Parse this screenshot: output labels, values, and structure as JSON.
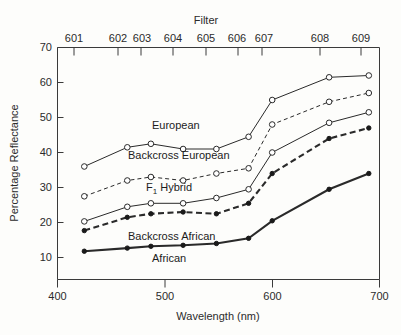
{
  "chart_data": {
    "type": "line",
    "title": "",
    "top_axis_label": "Filter",
    "xlabel": "Wavelength (nm)",
    "ylabel": "Percentage Reflectance",
    "xlim": [
      400,
      700
    ],
    "ylim": [
      10,
      70
    ],
    "xticks": [
      400,
      500,
      600,
      700
    ],
    "yticks": [
      10,
      20,
      30,
      40,
      50,
      60,
      70
    ],
    "grid": false,
    "legend_position": "inline-annotations",
    "filters": [
      "601",
      "602",
      "603",
      "604",
      "605",
      "606",
      "607",
      "608",
      "609"
    ],
    "filter_wavelengths": [
      425,
      465,
      487,
      517,
      548,
      578,
      600,
      653,
      690
    ],
    "x": [
      425,
      465,
      487,
      517,
      548,
      578,
      600,
      653,
      690
    ],
    "series": [
      {
        "name": "European",
        "marker": "open-circle",
        "line": "solid-thin",
        "values": [
          36.0,
          41.5,
          42.5,
          41.0,
          41.0,
          44.5,
          55.0,
          61.5,
          62.0
        ]
      },
      {
        "name": "Backcross European",
        "marker": "open-circle",
        "line": "dashed-thin",
        "values": [
          27.5,
          32.0,
          33.0,
          32.0,
          34.0,
          35.5,
          48.0,
          54.5,
          57.0
        ]
      },
      {
        "name": "F1 Hybrid",
        "marker": "open-circle",
        "line": "solid-thin",
        "values": [
          20.3,
          24.5,
          25.5,
          25.5,
          27.0,
          29.5,
          40.0,
          48.5,
          51.5
        ]
      },
      {
        "name": "Backcross African",
        "marker": "filled-circle",
        "line": "dashed-thick",
        "values": [
          17.7,
          21.5,
          22.5,
          23.0,
          22.5,
          25.5,
          34.0,
          44.0,
          47.0
        ]
      },
      {
        "name": "African",
        "marker": "filled-circle",
        "line": "solid-thick",
        "values": [
          11.8,
          12.7,
          13.2,
          13.5,
          14.0,
          15.5,
          20.5,
          29.5,
          34.0
        ]
      }
    ],
    "annotations": [
      {
        "text": "European",
        "x_px": 152,
        "y_px": 129
      },
      {
        "text": "Backcross European",
        "x_px": 128,
        "y_px": 159
      },
      {
        "text": "F1 Hybrid",
        "x_px": 146,
        "y_px": 191,
        "subscript": "1",
        "base": "F",
        "tail": " Hybrid"
      },
      {
        "text": "Backcross African",
        "x_px": 128,
        "y_px": 240
      },
      {
        "text": "African",
        "x_px": 152,
        "y_px": 262
      }
    ]
  }
}
